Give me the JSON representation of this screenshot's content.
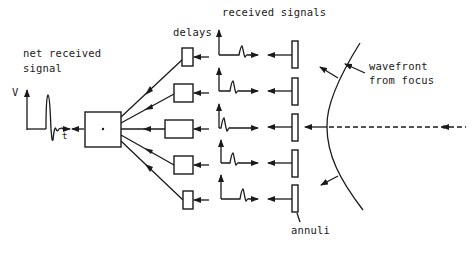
{
  "diagram": {
    "type": "block-diagram",
    "labels": {
      "net_received_signal_line1": "net received",
      "net_received_signal_line2": "signal",
      "v_axis": "V",
      "t_axis": "t",
      "delays": "delays",
      "received_signals": "received signals",
      "wavefront_line1": "wavefront",
      "wavefront_line2": "from focus",
      "annuli": "annuli",
      "summer_symbol": "+"
    },
    "channels": [
      {
        "id": 1,
        "delay_size": "small",
        "y": 57
      },
      {
        "id": 2,
        "delay_size": "medium",
        "y": 94
      },
      {
        "id": 3,
        "delay_size": "large",
        "y": 130
      },
      {
        "id": 4,
        "delay_size": "medium",
        "y": 165
      },
      {
        "id": 5,
        "delay_size": "small",
        "y": 200
      }
    ],
    "colors": {
      "ink": "#1a1a1a",
      "background": "#ffffff"
    }
  }
}
